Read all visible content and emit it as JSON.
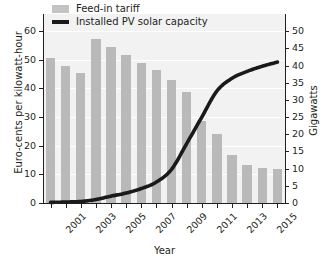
{
  "chart_data": {
    "type": "bar",
    "title": "",
    "xlabel": "Year",
    "ylabel": "Euro-cents per kilowatt-hour",
    "ylabel_right": "Gigawatts",
    "grid": true,
    "legend_position": "top-left",
    "x": [
      2001,
      2002,
      2003,
      2004,
      2005,
      2006,
      2007,
      2008,
      2009,
      2010,
      2011,
      2012,
      2013,
      2014,
      2015,
      2016
    ],
    "categories": [
      "2001",
      "2002",
      "2003",
      "2004",
      "2005",
      "2006",
      "2007",
      "2008",
      "2009",
      "2010",
      "2011",
      "2012",
      "2013",
      "2014",
      "2015",
      "2016"
    ],
    "xtick_labels": [
      "2001",
      "2003",
      "2005",
      "2007",
      "2009",
      "2011",
      "2013",
      "2015"
    ],
    "xtick_values": [
      2001,
      2003,
      2005,
      2007,
      2009,
      2011,
      2013,
      2015
    ],
    "ylim": [
      0,
      66
    ],
    "ytick_labels": [
      "0",
      "10",
      "20",
      "30",
      "40",
      "50",
      "60"
    ],
    "ytick_values": [
      0,
      10,
      20,
      30,
      40,
      50,
      60
    ],
    "ylim_right": [
      0,
      55
    ],
    "ytick_labels_right": [
      "0",
      "5",
      "10",
      "15",
      "20",
      "25",
      "30",
      "35",
      "40",
      "45",
      "50"
    ],
    "ytick_values_right": [
      0,
      5,
      10,
      15,
      20,
      25,
      30,
      35,
      40,
      45,
      50
    ],
    "series": [
      {
        "name": "Feed-in tariff",
        "type": "bar",
        "axis": "left",
        "unit": "Euro-cents per kilowatt-hour",
        "color": "#b9b9b9",
        "values": [
          50.6,
          48.0,
          45.4,
          57.4,
          54.5,
          51.6,
          49.0,
          46.4,
          42.9,
          38.8,
          28.7,
          24.2,
          16.8,
          13.4,
          12.3,
          11.9
        ]
      },
      {
        "name": "Installed PV solar capacity",
        "type": "line",
        "axis": "right",
        "unit": "Gigawatts",
        "color": "#1a1a1a",
        "values": [
          0.18,
          0.28,
          0.45,
          1.0,
          2.0,
          2.9,
          4.2,
          6.1,
          9.8,
          17.3,
          25.0,
          32.6,
          36.3,
          38.3,
          39.8,
          41.0
        ]
      }
    ]
  },
  "legend": {
    "items": [
      {
        "label": "Feed-in tariff",
        "marker": "bar-swatch",
        "color": "#c3c3c3"
      },
      {
        "label": "Installed PV solar capacity",
        "marker": "line-swatch",
        "color": "#1a1a1a"
      }
    ]
  },
  "axes": {
    "left_title": "Euro-cents per kilowatt-hour",
    "right_title": "Gigawatts",
    "bottom_title": "Year"
  },
  "colors": {
    "bar": "#b9b9b9",
    "line": "#1a1a1a",
    "plot_background": "#f2f2f2",
    "gridline": "#ffffff",
    "axis": "#231f20",
    "text": "#231f20"
  }
}
